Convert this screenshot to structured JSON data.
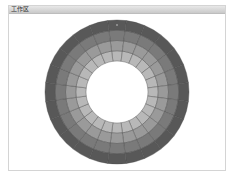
{
  "window": {
    "title": "工作区"
  },
  "wheel": {
    "center": [
      117,
      92
    ],
    "inner_radius": 31,
    "outer_radius": 72,
    "segments": 24,
    "ring_colors": [
      "#b8b8b8",
      "#9a9a9a",
      "#7a7a7a",
      "#585858"
    ],
    "segment_line_color": "#4a4a4a",
    "marker_color": "#8a8a8a"
  }
}
